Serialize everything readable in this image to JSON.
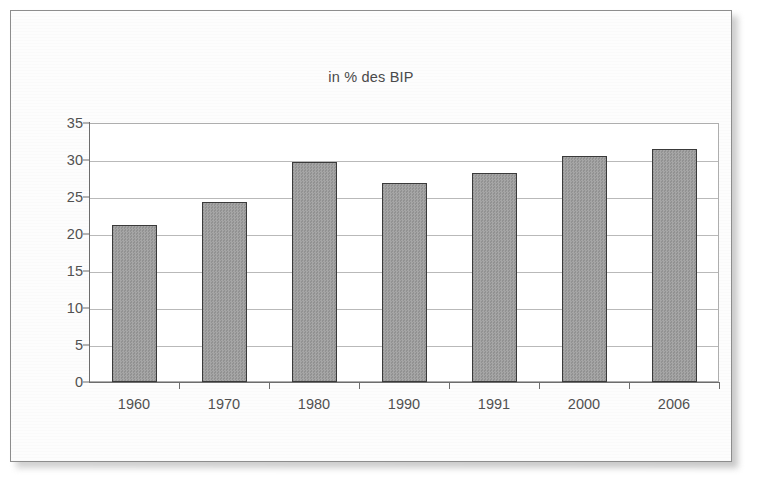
{
  "page": {
    "kind": "scanned-document-figure"
  },
  "chart_data": {
    "type": "bar",
    "title": "in % des BIP",
    "xlabel": "",
    "ylabel": "",
    "categories": [
      "1960",
      "1970",
      "1980",
      "1990",
      "1991",
      "2000",
      "2006"
    ],
    "values": [
      21.3,
      24.5,
      29.8,
      27.0,
      28.4,
      30.7,
      31.6
    ],
    "ylim": [
      0,
      35
    ],
    "ytick_labels": [
      "0",
      "5",
      "10",
      "15",
      "20",
      "25",
      "30",
      "35"
    ],
    "ytick_values": [
      0,
      5,
      10,
      15,
      20,
      25,
      30,
      35
    ],
    "grid": true,
    "legend": null,
    "legend_position": "none",
    "colors": {
      "bar_fill": "#9d9d9d",
      "bar_border": "#3a3a3a",
      "gridline": "#b9b9b9",
      "axis": "#6d6d6d",
      "text": "#515151",
      "title_text": "#4a4a4a",
      "page_background": "#fdfdfd",
      "plot_background": "#ffffff"
    }
  }
}
